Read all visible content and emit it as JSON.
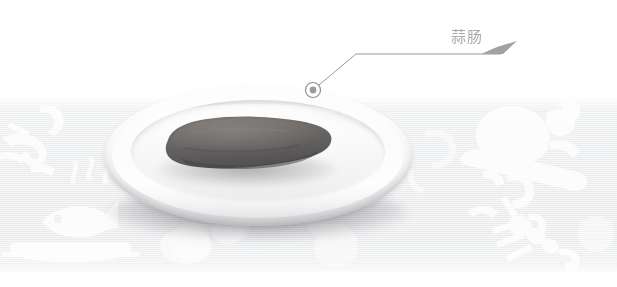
{
  "image": {
    "kind": "annotated-food-photo",
    "width": 617,
    "height": 287,
    "background_color": "#ffffff",
    "band_color": "#ebecee"
  },
  "subject": {
    "dish_name": "garlic-sausage",
    "plate": {
      "name": "white-oval-plate",
      "color": "#f7f7f8",
      "rim_shadow_color": "#d2d2d5"
    },
    "food": {
      "name": "sausage",
      "color": "#6d6a68",
      "highlight_color": "#8d8a87",
      "shadow_color": "#4a4846"
    }
  },
  "annotations": [
    {
      "id": "callout-1",
      "label": "蒜肠",
      "label_color": "#a9a9ab",
      "leader_line_color": "#9a9a9c",
      "marker": {
        "name": "callout-marker-dot",
        "x": 313,
        "y": 90,
        "ring_color": "#8e8e90",
        "dot_color": "#9b9b9d"
      },
      "elbow": {
        "x": 356,
        "y": 54
      },
      "end": {
        "x": 501,
        "y": 54
      }
    }
  ],
  "watermark": {
    "name": "food-icon-pattern",
    "color": "#ffffff",
    "opacity": 0.75,
    "icons": [
      "shrimp-icon",
      "fish-on-plate-icon",
      "roast-chicken-icon",
      "lobster-icon",
      "steam-icon",
      "bowl-icon"
    ]
  }
}
